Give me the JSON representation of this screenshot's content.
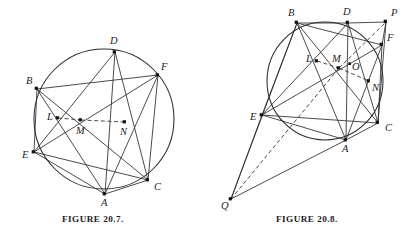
{
  "plate": {
    "type": "geometry-figure-plate",
    "background": "#ffffff",
    "ink_color": "#2b2b2b",
    "width": 413,
    "height": 241
  },
  "figures": [
    {
      "id": "figure-20-7",
      "caption": "FIGURE 20.7.",
      "conic": {
        "shape": "circle",
        "cx": 104,
        "cy": 119,
        "rx": 70,
        "ry": 70
      },
      "points": [
        {
          "name": "B",
          "x": 37,
          "y": 89,
          "label_x": 26,
          "label_y": 84,
          "on_conic": true
        },
        {
          "name": "D",
          "x": 115,
          "y": 52,
          "label_x": 110,
          "label_y": 44,
          "on_conic": true
        },
        {
          "name": "F",
          "x": 158,
          "y": 75,
          "label_x": 161,
          "label_y": 70,
          "on_conic": true
        },
        {
          "name": "C",
          "x": 148,
          "y": 180,
          "label_x": 154,
          "label_y": 190,
          "on_conic": true
        },
        {
          "name": "A",
          "x": 105,
          "y": 194,
          "label_x": 101,
          "label_y": 206,
          "on_conic": true
        },
        {
          "name": "E",
          "x": 34,
          "y": 152,
          "label_x": 22,
          "label_y": 158,
          "on_conic": true
        },
        {
          "name": "L",
          "x": 58,
          "y": 118,
          "label_x": 47,
          "label_y": 120,
          "on_conic": false
        },
        {
          "name": "M",
          "x": 81,
          "y": 120,
          "label_x": 76,
          "label_y": 134,
          "on_conic": false
        },
        {
          "name": "N",
          "x": 125,
          "y": 122,
          "label_x": 120,
          "label_y": 135,
          "on_conic": false
        }
      ],
      "solid_segments": [
        [
          "B",
          "E"
        ],
        [
          "B",
          "A"
        ],
        [
          "B",
          "C"
        ],
        [
          "B",
          "F"
        ],
        [
          "D",
          "E"
        ],
        [
          "D",
          "A"
        ],
        [
          "D",
          "C"
        ],
        [
          "F",
          "E"
        ],
        [
          "F",
          "A"
        ],
        [
          "F",
          "C"
        ],
        [
          "E",
          "A"
        ],
        [
          "E",
          "C"
        ],
        [
          "A",
          "C"
        ]
      ],
      "dashed_segments": [
        [
          "L",
          "M"
        ],
        [
          "M",
          "N"
        ]
      ]
    },
    {
      "id": "figure-20-8",
      "caption": "FIGURE 20.8.",
      "conic": {
        "shape": "ellipse",
        "cx": 325,
        "cy": 81,
        "rx": 58,
        "ry": 59
      },
      "points": [
        {
          "name": "B",
          "x": 297,
          "y": 23,
          "label_x": 288,
          "label_y": 16,
          "on_conic": true
        },
        {
          "name": "D",
          "x": 348,
          "y": 23,
          "label_x": 343,
          "label_y": 15,
          "on_conic": true
        },
        {
          "name": "P",
          "x": 386,
          "y": 22,
          "label_x": 391,
          "label_y": 16,
          "on_conic": false
        },
        {
          "name": "F",
          "x": 382,
          "y": 45,
          "label_x": 387,
          "label_y": 41,
          "on_conic": true
        },
        {
          "name": "C",
          "x": 378,
          "y": 123,
          "label_x": 385,
          "label_y": 131,
          "on_conic": true
        },
        {
          "name": "A",
          "x": 346,
          "y": 140,
          "label_x": 342,
          "label_y": 152,
          "on_conic": true
        },
        {
          "name": "E",
          "x": 262,
          "y": 115,
          "label_x": 250,
          "label_y": 120,
          "on_conic": true
        },
        {
          "name": "L",
          "x": 317,
          "y": 61,
          "label_x": 306,
          "label_y": 62,
          "on_conic": false
        },
        {
          "name": "M",
          "x": 339,
          "y": 68,
          "label_x": 333,
          "label_y": 62,
          "on_conic": false
        },
        {
          "name": "O",
          "x": 350,
          "y": 64,
          "label_x": 352,
          "label_y": 70,
          "on_conic": false
        },
        {
          "name": "N",
          "x": 369,
          "y": 81,
          "label_x": 372,
          "label_y": 91,
          "on_conic": false
        },
        {
          "name": "Q",
          "x": 231,
          "y": 199,
          "label_x": 221,
          "label_y": 209,
          "on_conic": false
        }
      ],
      "solid_segments": [
        [
          "B",
          "D"
        ],
        [
          "D",
          "P"
        ],
        [
          "P",
          "F"
        ],
        [
          "P",
          "C"
        ],
        [
          "B",
          "E"
        ],
        [
          "B",
          "A"
        ],
        [
          "B",
          "C"
        ],
        [
          "B",
          "F"
        ],
        [
          "D",
          "E"
        ],
        [
          "D",
          "A"
        ],
        [
          "D",
          "C"
        ],
        [
          "F",
          "E"
        ],
        [
          "F",
          "A"
        ],
        [
          "F",
          "C"
        ],
        [
          "E",
          "A"
        ],
        [
          "E",
          "C"
        ],
        [
          "A",
          "C"
        ],
        [
          "Q",
          "E"
        ],
        [
          "Q",
          "A"
        ],
        [
          "Q",
          "B"
        ]
      ],
      "dashed_segments": [
        [
          "L",
          "M"
        ],
        [
          "M",
          "N"
        ],
        [
          "Q",
          "M"
        ],
        [
          "M",
          "P"
        ]
      ]
    }
  ]
}
